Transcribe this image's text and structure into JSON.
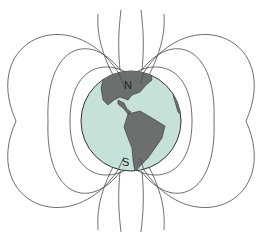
{
  "diagram": {
    "title": "",
    "labels": {
      "north": "N",
      "south": "S"
    },
    "colors": {
      "background": "#ffffff",
      "ocean": "#c6e0da",
      "land": "#6b6f6e",
      "field_lines": "#4a4a4a",
      "outline": "#333333"
    },
    "globe": {
      "cx": 131,
      "cy": 121,
      "r": 50
    }
  }
}
